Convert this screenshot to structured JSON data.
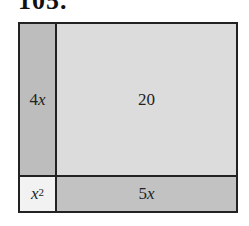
{
  "problem_number": "105.",
  "diagram": {
    "colors": {
      "border": "#222222",
      "strip_4x": "#bdbdbd",
      "area_20": "#dcdcdc",
      "square_x2": "#f2f2f2",
      "strip_5x": "#c2c2c2"
    },
    "cells": {
      "top_left": {
        "coef": "4",
        "var": "x"
      },
      "top_right": {
        "value": "20"
      },
      "bottom_left": {
        "var": "x",
        "exp": "2"
      },
      "bottom_right": {
        "coef": "5",
        "var": "x"
      }
    }
  }
}
